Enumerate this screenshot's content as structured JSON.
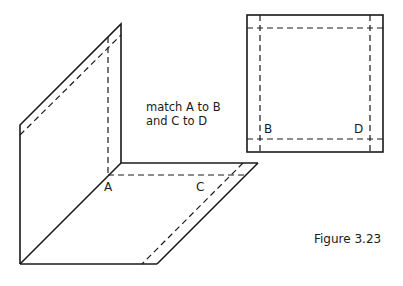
{
  "instructions": {
    "line1": "match A to B",
    "line2": "and C to D"
  },
  "labels": {
    "A": "A",
    "B": "B",
    "C": "C",
    "D": "D"
  },
  "caption": "Figure 3.23",
  "figure": {
    "folded_net": {
      "description": "L-shaped net: vertical wall panel and floor panel in oblique projection, with dashed tab/fold lines",
      "wall_panel": [
        [
          20,
          125
        ],
        [
          121,
          24
        ],
        [
          121,
          163
        ],
        [
          20,
          264
        ]
      ],
      "floor_panel": [
        [
          121,
          163
        ],
        [
          258,
          163
        ],
        [
          157,
          264
        ],
        [
          20,
          264
        ]
      ]
    },
    "square_piece": {
      "description": "Flat square with dashed fold lines inset on all four sides",
      "outer": [
        247,
        15,
        383,
        152
      ]
    }
  }
}
